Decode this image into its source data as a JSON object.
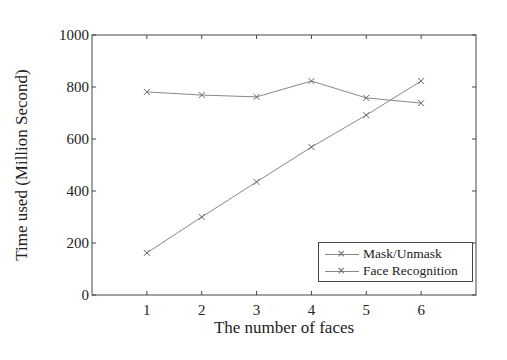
{
  "chart_data": {
    "type": "line",
    "title": "",
    "xlabel": "The number of faces",
    "ylabel": "Time used (Million Second)",
    "x": [
      1,
      2,
      3,
      4,
      5,
      6
    ],
    "xlim": [
      0,
      7
    ],
    "ylim": [
      0,
      1000
    ],
    "xticks": [
      "1",
      "2",
      "3",
      "4",
      "5",
      "6"
    ],
    "yticks": [
      "0",
      "200",
      "400",
      "600",
      "800",
      "1000"
    ],
    "grid": false,
    "legend_position": "lower right",
    "marker": "x",
    "series": [
      {
        "name": "Mask/Unmask",
        "values": [
          162,
          300,
          435,
          569,
          692,
          823
        ],
        "color": "#888888"
      },
      {
        "name": "Face Recognition",
        "values": [
          781,
          769,
          762,
          823,
          758,
          738
        ],
        "color": "#888888"
      }
    ]
  }
}
